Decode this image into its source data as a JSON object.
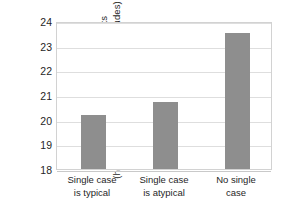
{
  "chart_data": {
    "type": "bar",
    "title": "",
    "subtitle": "",
    "xlabel": "",
    "ylabel": "Attitudes toward welfare recipients (higher number = more positive attitudes)",
    "ylabel_lines": [
      "Attitudes toward welfare recipients",
      "(higher number = more positive attitudes)"
    ],
    "categories": [
      "Single case is typical",
      "Single case is atypical",
      "No single case"
    ],
    "category_lines": [
      [
        "Single case",
        "is typical"
      ],
      [
        "Single case",
        "is atypical"
      ],
      [
        "No single",
        "case"
      ]
    ],
    "values": [
      20.2,
      20.7,
      23.5
    ],
    "ylim": [
      18,
      24
    ],
    "yticks": [
      18,
      19,
      20,
      21,
      22,
      23,
      24
    ],
    "ytick_labels": [
      "18",
      "19",
      "20",
      "21",
      "22",
      "23",
      "24"
    ],
    "grid": true,
    "grid_axis": "y",
    "legend": false,
    "legend_position": "none",
    "bar_color": "#8e8e8e",
    "grid_color": "#dedede",
    "axis_color": "#d2d2d2",
    "background_color": "#ffffff"
  }
}
